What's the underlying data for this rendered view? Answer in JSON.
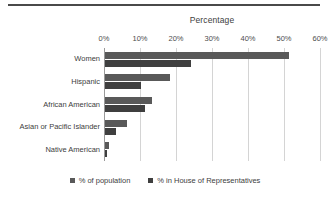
{
  "chart_data": {
    "type": "bar",
    "orientation": "horizontal",
    "title": "Percentage",
    "xlabel": "",
    "ylabel": "",
    "xlim": [
      0,
      60
    ],
    "grid": true,
    "legend_position": "bottom",
    "axis_label_position": "top",
    "categories": [
      "Women",
      "Hispanic",
      "African American",
      "Asian or Pacific Islander",
      "Native American"
    ],
    "tick_labels": [
      "0%",
      "10%",
      "20%",
      "30%",
      "40%",
      "50%",
      "60%"
    ],
    "tick_values": [
      0,
      10,
      20,
      30,
      40,
      50,
      60
    ],
    "series": [
      {
        "name": "% of population",
        "color": "#595959",
        "values": [
          51,
          18,
          13,
          6,
          1
        ]
      },
      {
        "name": "% in House of Representatives",
        "color": "#3f3f3f",
        "values": [
          24,
          10,
          11,
          3,
          0.5
        ]
      }
    ]
  },
  "colors": {
    "series_population": "#595959",
    "series_house": "#3f3f3f",
    "gridline": "#d4d4d4",
    "axis": "#9a9a9a",
    "rule": "#4a4a4a",
    "text": "#404040",
    "background": "#ffffff"
  }
}
